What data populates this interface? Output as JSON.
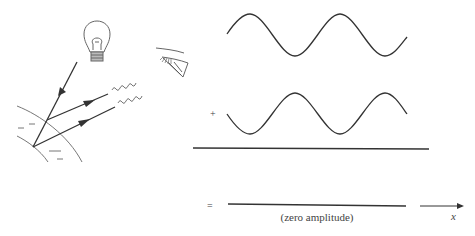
{
  "figure": {
    "left_panel": {
      "light_source": "light-bulb-icon",
      "observer": "eye-icon",
      "surface_charges": [
        "−",
        "−",
        "−",
        "−"
      ],
      "rays": [
        "incident-ray",
        "reflected-ray-1",
        "reflected-ray-2"
      ]
    },
    "right_panel": {
      "plus_sign": "+",
      "equals_sign": "=",
      "result_label": "(zero amplitude)",
      "axis_label": "x"
    },
    "colors": {
      "line": "#333333",
      "light_line": "#777777",
      "background": "#ffffff"
    }
  }
}
